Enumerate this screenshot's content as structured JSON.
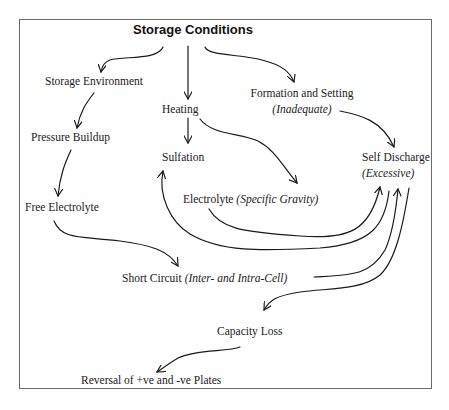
{
  "diagram": {
    "title": "Storage Conditions",
    "nodes": {
      "storage_environment": {
        "label": "Storage Environment"
      },
      "heating": {
        "label": "Heating"
      },
      "formation_setting": {
        "label": "Formation and Setting",
        "qualifier": "(Inadequate)"
      },
      "pressure_buildup": {
        "label": "Pressure Buildup"
      },
      "sulfation": {
        "label": "Sulfation"
      },
      "self_discharge": {
        "label": "Self Discharge",
        "qualifier": "(Excessive)"
      },
      "free_electrolyte": {
        "label": "Free Electrolyte"
      },
      "electrolyte": {
        "label": "Electrolyte ",
        "qualifier": "(Specific Gravity)"
      },
      "short_circuit": {
        "label": "Short Circuit ",
        "qualifier": "(Inter- and Intra-Cell)"
      },
      "capacity_loss": {
        "label": "Capacity Loss"
      },
      "reversal": {
        "label": "Reversal of +ve and -ve Plates"
      }
    },
    "edges": [
      {
        "from": "Storage Conditions",
        "to": "Storage Environment"
      },
      {
        "from": "Storage Conditions",
        "to": "Heating"
      },
      {
        "from": "Storage Conditions",
        "to": "Formation and Setting"
      },
      {
        "from": "Storage Environment",
        "to": "Pressure Buildup"
      },
      {
        "from": "Pressure Buildup",
        "to": "Free Electrolyte"
      },
      {
        "from": "Heating",
        "to": "Sulfation"
      },
      {
        "from": "Heating",
        "to": "Electrolyte (Specific Gravity)"
      },
      {
        "from": "Formation and Setting",
        "to": "Self Discharge"
      },
      {
        "from": "Free Electrolyte",
        "to": "Short Circuit"
      },
      {
        "from": "Electrolyte (Specific Gravity)",
        "to": "Self Discharge"
      },
      {
        "from": "Self Discharge",
        "to": "Sulfation"
      },
      {
        "from": "Short Circuit",
        "to": "Self Discharge"
      },
      {
        "from": "Self Discharge",
        "to": "Capacity Loss"
      },
      {
        "from": "Capacity Loss",
        "to": "Reversal of +ve and -ve Plates"
      }
    ]
  }
}
